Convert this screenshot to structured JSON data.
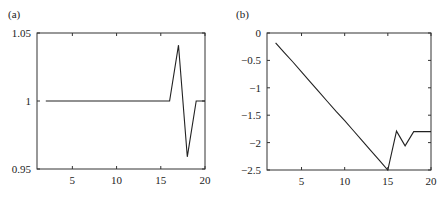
{
  "chart_data": [
    {
      "type": "line",
      "panel_label": "(a)",
      "title": "",
      "xlabel": "",
      "ylabel": "",
      "xlim": [
        1,
        20
      ],
      "ylim": [
        0.95,
        1.05
      ],
      "x_ticks": [
        5,
        10,
        15,
        20
      ],
      "x_tick_labels": [
        "5",
        "10",
        "15",
        "20"
      ],
      "y_ticks": [
        0.95,
        1,
        1.05
      ],
      "y_tick_labels": [
        "0.95",
        "1",
        "1.05"
      ],
      "grid": false,
      "legend": null,
      "series": [
        {
          "name": "a",
          "x": [
            2,
            3,
            4,
            5,
            6,
            7,
            8,
            9,
            10,
            11,
            12,
            13,
            14,
            15,
            16,
            17,
            18,
            19,
            20
          ],
          "values": [
            1,
            1,
            1,
            1,
            1,
            1,
            1,
            1,
            1,
            1,
            1,
            1,
            1,
            1,
            1,
            1.041,
            0.959,
            1,
            1
          ]
        }
      ]
    },
    {
      "type": "line",
      "panel_label": "(b)",
      "title": "",
      "xlabel": "",
      "ylabel": "",
      "xlim": [
        1,
        20
      ],
      "ylim": [
        -2.5,
        0
      ],
      "x_ticks": [
        5,
        10,
        15,
        20
      ],
      "x_tick_labels": [
        "5",
        "10",
        "15",
        "20"
      ],
      "y_ticks": [
        0,
        -0.5,
        -1,
        -1.5,
        -2,
        -2.5
      ],
      "y_tick_labels": [
        "0",
        "−0.5",
        "−1",
        "−1.5",
        "−2",
        "−2.5"
      ],
      "grid": false,
      "legend": null,
      "series": [
        {
          "name": "b",
          "x": [
            2,
            3,
            4,
            5,
            6,
            7,
            8,
            9,
            10,
            11,
            12,
            13,
            14,
            15,
            16,
            17,
            18,
            19,
            20
          ],
          "values": [
            -0.18,
            -0.36,
            -0.53,
            -0.71,
            -0.89,
            -1.07,
            -1.25,
            -1.43,
            -1.6,
            -1.78,
            -1.96,
            -2.14,
            -2.32,
            -2.5,
            -1.79,
            -2.06,
            -1.8,
            -1.8,
            -1.8
          ]
        }
      ]
    }
  ]
}
